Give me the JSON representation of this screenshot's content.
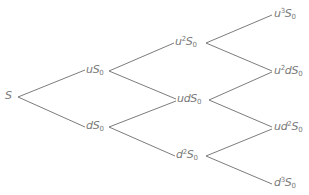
{
  "diagram": {
    "type": "binomial-tree",
    "steps": 3,
    "colors": {
      "line": "#6d6d6d",
      "text": "#7a7a7a",
      "background": "#ffffff"
    },
    "nodes": {
      "root": {
        "base": "S",
        "pre": "",
        "sup": "",
        "mid": "",
        "sup2": "",
        "sub": ""
      },
      "u": {
        "pre": "u",
        "sup": "",
        "mid": "",
        "sup2": "",
        "base": "S",
        "sub": "0"
      },
      "d": {
        "pre": "d",
        "sup": "",
        "mid": "",
        "sup2": "",
        "base": "S",
        "sub": "0"
      },
      "uu": {
        "pre": "u",
        "sup": "2",
        "mid": "",
        "sup2": "",
        "base": "S",
        "sub": "0"
      },
      "ud": {
        "pre": "ud",
        "sup": "",
        "mid": "",
        "sup2": "",
        "base": "S",
        "sub": "0"
      },
      "dd": {
        "pre": "d",
        "sup": "2",
        "mid": "",
        "sup2": "",
        "base": "S",
        "sub": "0"
      },
      "uuu": {
        "pre": "u",
        "sup": "3",
        "mid": "",
        "sup2": "",
        "base": "S",
        "sub": "0"
      },
      "uud": {
        "pre": "u",
        "sup": "2",
        "mid": "d",
        "sup2": "",
        "base": "S",
        "sub": "0"
      },
      "udd": {
        "pre": "ud",
        "sup": "2",
        "mid": "",
        "sup2": "",
        "base": "S",
        "sub": "0"
      },
      "ddd": {
        "pre": "d",
        "sup": "3",
        "mid": "",
        "sup2": "",
        "base": "S",
        "sub": "0"
      }
    },
    "labels_plain": [
      "S",
      "uS0",
      "dS0",
      "u^2S0",
      "udS0",
      "d^2S0",
      "u^3S0",
      "u^2dS0",
      "ud^2S0",
      "d^3S0"
    ]
  }
}
